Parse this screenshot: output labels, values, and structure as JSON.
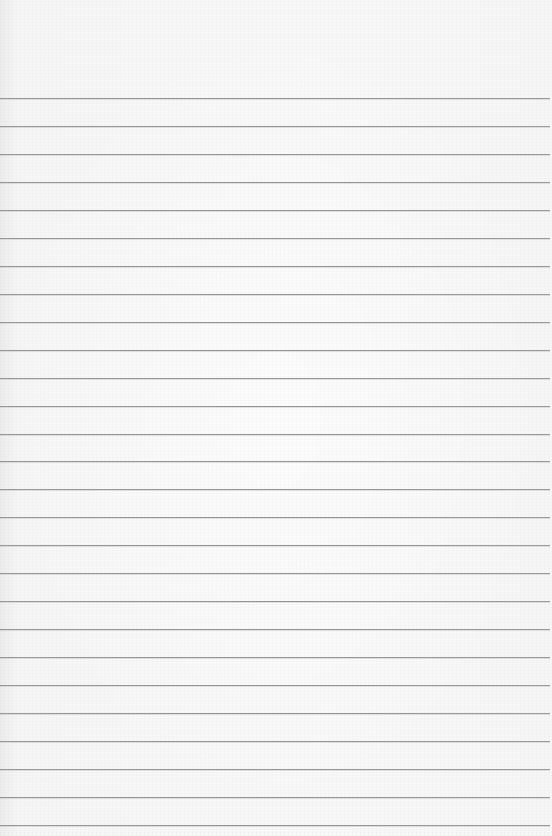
{
  "page": {
    "type": "blank lined paper",
    "background_color": "#f7f7f7",
    "rule_color": "#8a8a8a",
    "rule_count": 27,
    "first_rule_y": 98,
    "rule_spacing": 27.96,
    "text": ""
  }
}
